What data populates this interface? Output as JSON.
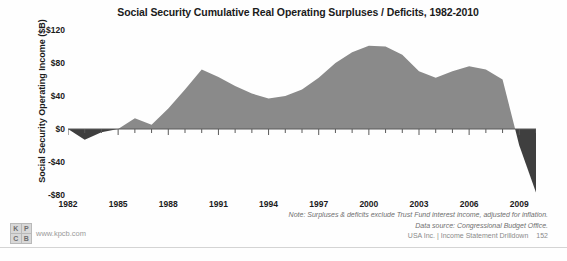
{
  "chart": {
    "title": "Social Security Cumulative Real Operating Surpluses / Deficits, 1982-2010",
    "ylabel": "Social Security Operating Income ($B)"
  },
  "notes": {
    "line1": "Note: Surpluses & deficits exclude Trust Fund interest income, adjusted for inflation.",
    "line2": "Data source: Congressional Budget Office.",
    "line3": "USA Inc. | Income Statement Drilldown",
    "page": "152"
  },
  "logo": {
    "cell1": "K",
    "cell2": "P",
    "cell3": "C",
    "cell4": "B",
    "url": "www.kpcb.com"
  },
  "chart_data": {
    "type": "area",
    "title": "Social Security Cumulative Real Operating Surpluses / Deficits, 1982-2010",
    "xlabel": "",
    "ylabel": "Social Security Operating Income ($B)",
    "ylim": [
      -80,
      120
    ],
    "xlim": [
      1982,
      2010
    ],
    "yticks": [
      120,
      80,
      40,
      0,
      -40,
      -80
    ],
    "ytick_labels": [
      "$120",
      "$80",
      "$40",
      "$0",
      "-$40",
      "-$80"
    ],
    "xticks": [
      1982,
      1985,
      1988,
      1991,
      1994,
      1997,
      2000,
      2003,
      2006,
      2009
    ],
    "xtick_labels": [
      "1982",
      "1985",
      "1988",
      "1991",
      "1994",
      "1997",
      "2000",
      "2003",
      "2006",
      "2009"
    ],
    "xtick_step": 3,
    "minor_xtick_step": 1,
    "grid": false,
    "legend": false,
    "zero_line": true,
    "fill_color": "#8a8a8a",
    "negative_fill_color": "#3f3f3f",
    "series_name": "Cumulative real operating surplus / deficit",
    "x": [
      1982,
      1983,
      1984,
      1985,
      1986,
      1987,
      1988,
      1989,
      1990,
      1991,
      1992,
      1993,
      1994,
      1995,
      1996,
      1997,
      1998,
      1999,
      2000,
      2001,
      2002,
      2003,
      2004,
      2005,
      2006,
      2007,
      2008,
      2009,
      2010
    ],
    "values": [
      0,
      -13,
      -4,
      0,
      13,
      5,
      25,
      48,
      72,
      63,
      52,
      43,
      37,
      40,
      48,
      62,
      80,
      93,
      101,
      100,
      90,
      70,
      62,
      70,
      76,
      72,
      60,
      -20,
      -77
    ]
  }
}
